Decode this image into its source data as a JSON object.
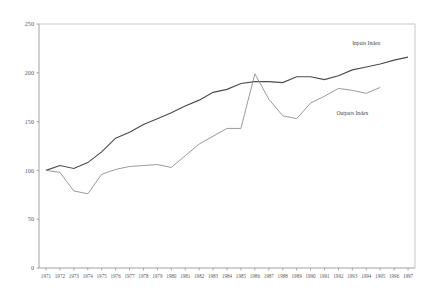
{
  "chart_data": {
    "type": "line",
    "title": "",
    "subtitle": "",
    "xlabel": "",
    "ylabel": "",
    "xlim": [
      1971,
      1997
    ],
    "ylim": [
      0,
      250
    ],
    "grid": false,
    "legend_position": "inline-annotation",
    "y_ticks": [
      0,
      50,
      100,
      150,
      200,
      250
    ],
    "y_tick_labels": [
      "0",
      "50",
      "100",
      "150",
      "200",
      "250"
    ],
    "categories": [
      "1971",
      "1972",
      "1973",
      "1974",
      "1975",
      "1976",
      "1977",
      "1978",
      "1979",
      "1980",
      "1981",
      "1982",
      "1983",
      "1984",
      "1985",
      "1986",
      "1987",
      "1988",
      "1989",
      "1990",
      "1991",
      "1992",
      "1993",
      "1994",
      "1995",
      "1996",
      "1997"
    ],
    "x": [
      1971,
      1972,
      1973,
      1974,
      1975,
      1976,
      1977,
      1978,
      1979,
      1980,
      1981,
      1982,
      1983,
      1984,
      1985,
      1986,
      1987,
      1988,
      1989,
      1990,
      1991,
      1992,
      1993,
      1994,
      1995,
      1996,
      1997
    ],
    "series": [
      {
        "name": "Inputs Index",
        "color": "#4c4c4c",
        "label_x": 1994,
        "label_y": 228,
        "values": [
          100,
          105,
          102,
          108,
          119,
          133,
          139,
          147,
          153,
          159,
          166,
          172,
          180,
          183,
          189,
          191,
          191,
          190,
          196,
          196,
          193,
          197,
          203,
          206,
          209,
          213,
          216
        ]
      },
      {
        "name": "Outputs Index",
        "color": "#8e8e8e",
        "label_x": 1993,
        "label_y": 157,
        "values": [
          100,
          98,
          79,
          76,
          96,
          101,
          104,
          105,
          106,
          103,
          115,
          127,
          135,
          143,
          143,
          199,
          173,
          156,
          153,
          169,
          176,
          184,
          182,
          179,
          185,
          null,
          null
        ]
      }
    ]
  },
  "annotations": {
    "inputs_label": "Inputs Index",
    "outputs_label": "Outputs Index"
  }
}
